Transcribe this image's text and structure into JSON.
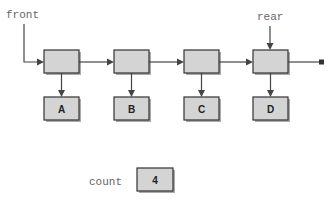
{
  "diagram": {
    "pointers": {
      "front": "front",
      "rear": "rear"
    },
    "nodes": [
      {
        "data": "A"
      },
      {
        "data": "B"
      },
      {
        "data": "C"
      },
      {
        "data": "D"
      }
    ],
    "count": {
      "label": "count",
      "value": "4"
    },
    "colors": {
      "node_fill": "#d4d4d4",
      "stroke": "#333333",
      "label_text": "#666666"
    }
  }
}
